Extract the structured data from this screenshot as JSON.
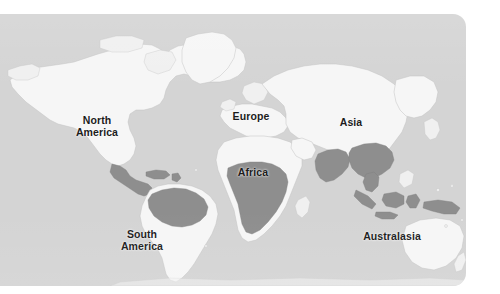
{
  "figure": {
    "type": "world-map",
    "panel": {
      "ocean_color": "#d4d4d4",
      "land_color": "#f6f6f6",
      "land_outline_color": "#c3c3c3",
      "shaded_region_color": "#8e8e8e",
      "label_color": "#1c1c1c",
      "background_color": "#ffffff",
      "corner_radius_px": 13
    }
  },
  "labels": [
    {
      "id": "north-america",
      "text": "North\nAmerica",
      "x": 97,
      "y": 112
    },
    {
      "id": "south-america",
      "text": "South\nAmerica",
      "x": 142,
      "y": 226
    },
    {
      "id": "europe",
      "text": "Europe",
      "x": 251,
      "y": 102
    },
    {
      "id": "africa",
      "text": "Africa",
      "x": 253,
      "y": 158
    },
    {
      "id": "asia",
      "text": "Asia",
      "x": 351,
      "y": 108
    },
    {
      "id": "australasia",
      "text": "Australasia",
      "x": 392,
      "y": 222
    }
  ],
  "shaded_regions": [
    "Central America and Caribbean",
    "Northern South America (Amazon basin)",
    "Central and Southern Africa",
    "Indian subcontinent",
    "Southeast Asia",
    "Indonesia and New Guinea"
  ]
}
